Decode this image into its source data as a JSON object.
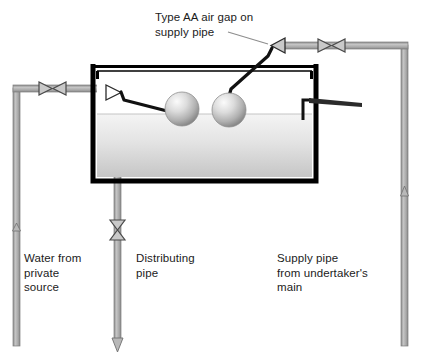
{
  "diagram": {
    "labels": {
      "air_gap": "Type AA air gap on\nsupply pipe",
      "private_source": "Water from\nprivate\nsource",
      "distributing_pipe": "Distributing\npipe",
      "supply_pipe": "Supply pipe\nfrom undertaker's\nmain"
    },
    "colors": {
      "pipe_fill": "#b3b3b3",
      "pipe_stroke": "#7d7d7d",
      "tank_wall": "#000000",
      "water_top": "#f2f2f2",
      "water_bottom": "#c9c9c9",
      "ball_light": "#f2f2f2",
      "ball_dark": "#8a8a8a",
      "text": "#1b1b1b",
      "leader_line": "#8d8d8d",
      "background": "#ffffff"
    },
    "components": {
      "tank": "storage cistern",
      "float_valve_left": "float operated valve on private supply",
      "float_valve_right": "float operated valve on undertaker's supply",
      "ball_float_left": "ball float",
      "ball_float_right": "ball float",
      "overflow": "warning/overflow pipe",
      "valve_left_pipe": "gate valve",
      "valve_top_right": "gate valve",
      "valve_air_gap": "discharge valve at air gap",
      "valve_distributing": "gate valve on distributing pipe",
      "flow_arrow_left": "upward flow",
      "flow_arrow_right": "upward flow",
      "flow_arrow_distributing": "downward flow"
    }
  }
}
